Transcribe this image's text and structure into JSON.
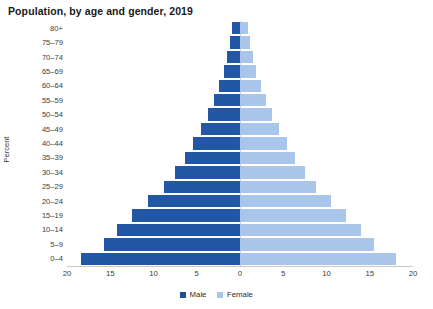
{
  "chart_data": {
    "type": "bar",
    "subtype": "population-pyramid",
    "title": "Population, by age and gender, 2019",
    "xlabel": "",
    "ylabel": "Percent",
    "categories": [
      "80+",
      "75-79",
      "70-74",
      "65-69",
      "60-64",
      "55-59",
      "50-54",
      "45-49",
      "40-44",
      "35-39",
      "30-34",
      "25-29",
      "20-24",
      "15-19",
      "10-14",
      "5-9",
      "0-4"
    ],
    "series": [
      {
        "name": "Male",
        "color": "#2257a5",
        "values": [
          0.9,
          1.1,
          1.5,
          1.9,
          2.4,
          3.0,
          3.7,
          4.5,
          5.4,
          6.4,
          7.5,
          8.8,
          10.6,
          12.5,
          14.2,
          15.7,
          18.4
        ]
      },
      {
        "name": "Female",
        "color": "#a9c6ea",
        "values": [
          0.9,
          1.1,
          1.5,
          1.9,
          2.4,
          3.0,
          3.7,
          4.5,
          5.4,
          6.4,
          7.5,
          8.8,
          10.5,
          12.3,
          14.0,
          15.5,
          18.0
        ]
      }
    ],
    "xticks": [
      20,
      15,
      10,
      5,
      0,
      5,
      10,
      15,
      20
    ],
    "xlim": [
      -20,
      20
    ],
    "grid": false,
    "legend_position": "bottom",
    "legend": [
      "Male",
      "Female"
    ]
  },
  "legend": {
    "male_label": "Male",
    "female_label": "Female"
  },
  "axis": {
    "y_title": "Percent"
  }
}
